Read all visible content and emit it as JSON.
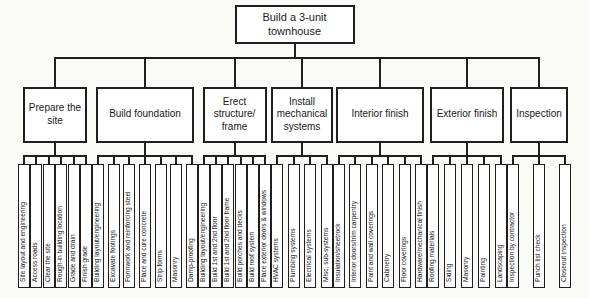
{
  "diagram": {
    "type": "work-breakdown-structure",
    "root": {
      "label": "Build a 3-unit townhouse"
    },
    "groups": [
      {
        "label": "Prepare the site",
        "tasks": [
          "Site layout and engineering",
          "Access roads",
          "Clear the site",
          "Rough-in building location",
          "Grade and drain",
          "Finish grade"
        ]
      },
      {
        "label": "Build foundation",
        "tasks": [
          "Building layout/engineering",
          "Excavate footings",
          "Formwork and reinforcing steel",
          "Place and cure concrete",
          "Strip forms",
          "Masonry",
          "Damp-proofing"
        ]
      },
      {
        "label": "Erect structure/​frame",
        "tasks": [
          "Building layout/engineering",
          "Build 1st and 2nd floor",
          "Build 1st and 2nd floor frame",
          "Build porches and decks",
          "Build roof system",
          "Place exterior doors & windows"
        ]
      },
      {
        "label": "Install mechanical systems",
        "tasks": [
          "HVAC systems",
          "Plumbing systems",
          "Electrical systems",
          "Misc. sub-systems"
        ]
      },
      {
        "label": "Interior finish",
        "tasks": [
          "Insulation/sheetrock",
          "Interior doors/trim carpentry",
          "Paint and wall coverings",
          "Cabinetry",
          "Floor coverings",
          "Hardware/mechanical finish"
        ]
      },
      {
        "label": "Exterior finish",
        "tasks": [
          "Roofing materials",
          "Siding",
          "Masonry",
          "Painting",
          "Landscaping"
        ]
      },
      {
        "label": "Inspection",
        "tasks": [
          "Inspection by contractor",
          "Punch list check",
          "Closeout inspection"
        ]
      }
    ]
  },
  "colors": {
    "line": "#1f1f1f",
    "box_background": "#ffffff",
    "page_background": "#fafaf7",
    "text": "#1a1a1a"
  }
}
